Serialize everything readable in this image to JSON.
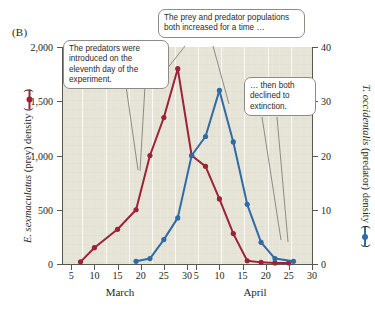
{
  "figure": {
    "panel_label": "(B)"
  },
  "colors": {
    "prey": "#9b2335",
    "predator": "#2f6ba5",
    "plot_background": "#e6e4d7",
    "axis": "#5a5650",
    "text": "#231f20",
    "callout_border": "#8d8b86"
  },
  "axes": {
    "left": {
      "title_italic_1": "E. sexmaculatus",
      "title_rest": " (prey) density (",
      "title_close": ")",
      "ticks": [
        "0",
        "500",
        "1,000",
        "1,500",
        "2,000"
      ],
      "min": 0,
      "max": 2000
    },
    "right": {
      "title_italic_1": "T. occidentalis",
      "title_rest": " (predator) density (",
      "title_close": ")",
      "ticks": [
        "0",
        "10",
        "20",
        "30",
        "40"
      ],
      "min": 0,
      "max": 40
    },
    "bottom": {
      "ticks": [
        "5",
        "10",
        "15",
        "20",
        "25",
        "30",
        "5",
        "10",
        "15",
        "20",
        "25",
        "30"
      ],
      "month_labels": [
        "March",
        "April"
      ]
    }
  },
  "callouts": {
    "predators_introduced": "The predators were introduced on the eleventh day of the experiment.",
    "both_increased": "The prey and predator populations both increased for a time …",
    "both_declined": "… then both declined to extinction."
  },
  "chart_data": {
    "type": "line",
    "title": "",
    "xlabel": "",
    "ylabel": "E. sexmaculatus (prey) density",
    "y2label": "T. occidentalis (predator) density",
    "xlim": [
      3,
      57
    ],
    "ylim": [
      0,
      2000
    ],
    "y2lim": [
      0,
      40
    ],
    "grid": "vertical-only",
    "legend_position": "inline-axis-titles",
    "x_tick_labels": [
      "5",
      "10",
      "15",
      "20",
      "25",
      "30",
      "5",
      "10",
      "15",
      "20",
      "25",
      "30"
    ],
    "x_tick_values": [
      5,
      10,
      15,
      20,
      25,
      30,
      32,
      37,
      42,
      47,
      52,
      57
    ],
    "x_axis_note": "Days of March 5-30 followed by April 5-30 on a continuous scale",
    "series": [
      {
        "name": "E. sexmaculatus (prey)",
        "axis": "left",
        "color": "#9b2335",
        "marker": "circle",
        "x": [
          7,
          10,
          15,
          19,
          22,
          25,
          28,
          31,
          34,
          37,
          40,
          43,
          46,
          49,
          52
        ],
        "values": [
          20,
          150,
          320,
          500,
          1000,
          1350,
          1800,
          1000,
          900,
          600,
          280,
          30,
          15,
          10,
          10
        ]
      },
      {
        "name": "T. occidentalis (predator)",
        "axis": "right",
        "color": "#2f6ba5",
        "marker": "circle",
        "x": [
          19,
          22,
          25,
          28,
          31,
          34,
          37,
          40,
          43,
          46,
          49,
          53
        ],
        "values": [
          0.5,
          1.0,
          4.5,
          8.5,
          20.0,
          23.5,
          32.0,
          22.5,
          11.0,
          4.0,
          1.0,
          0.5
        ]
      }
    ],
    "annotations": [
      "The predators were introduced on the eleventh day of the experiment.",
      "The prey and predator populations both increased for a time …",
      "… then both declined to extinction."
    ]
  }
}
